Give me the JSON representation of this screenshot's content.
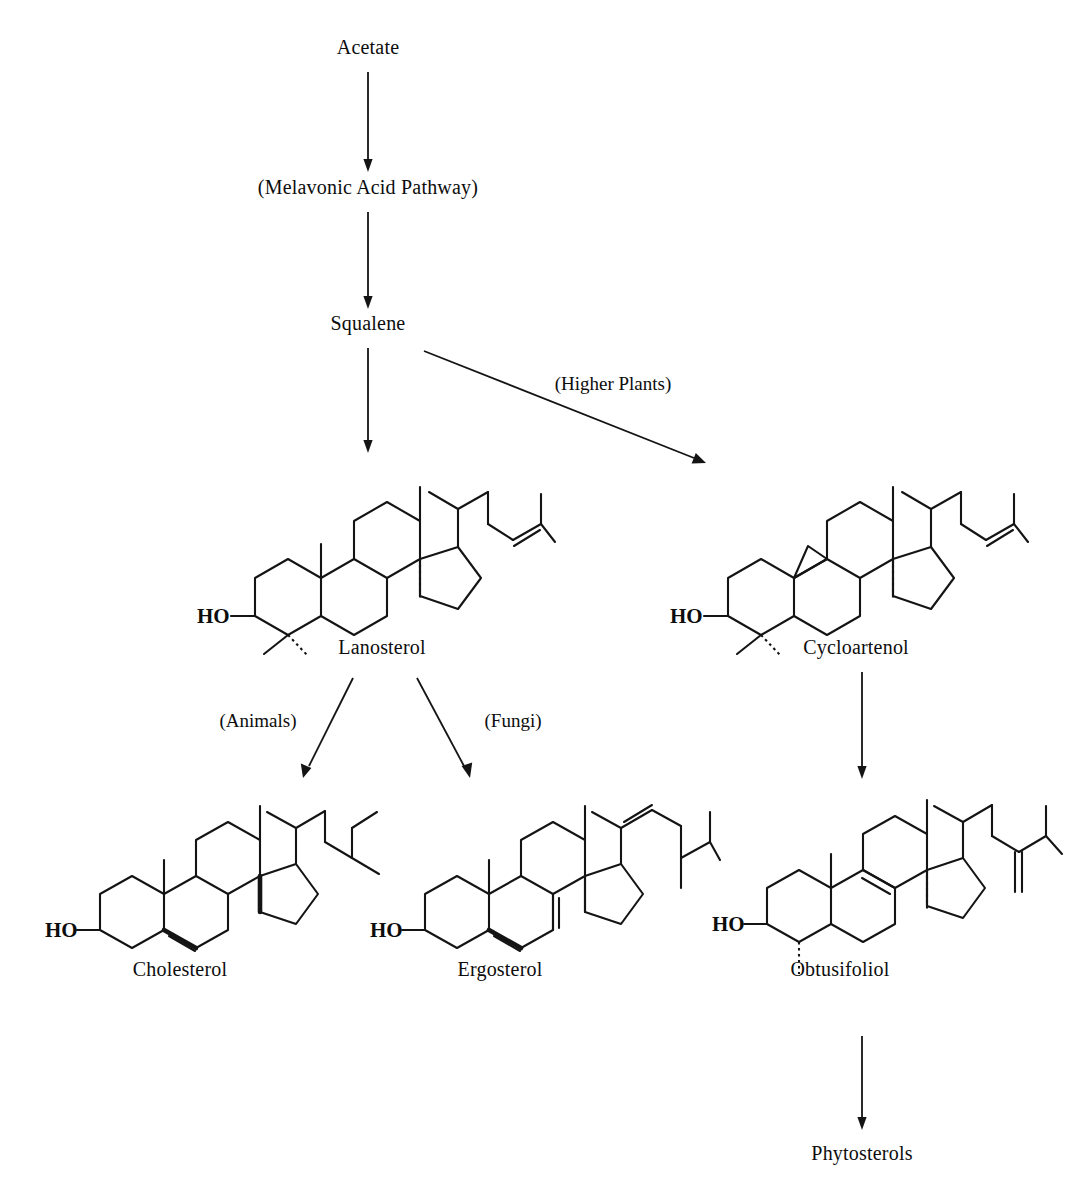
{
  "diagram": {
    "background_color": "#ffffff",
    "ink_color": "#141414",
    "nodes": [
      {
        "id": "acetate",
        "label": "Acetate",
        "x": 368,
        "y": 47,
        "has_structure": false
      },
      {
        "id": "mevalonate",
        "label": "(Melavonic Acid Pathway)",
        "x": 368,
        "y": 187,
        "has_structure": false
      },
      {
        "id": "squalene",
        "label": "Squalene",
        "x": 368,
        "y": 323,
        "has_structure": false
      },
      {
        "id": "lanosterol",
        "label": "Lanosterol",
        "x": 368,
        "y": 646,
        "has_structure": true
      },
      {
        "id": "cycloartenol",
        "label": "Cycloartenol",
        "x": 842,
        "y": 646,
        "has_structure": true
      },
      {
        "id": "cholesterol",
        "label": "Cholesterol",
        "x": 180,
        "y": 968,
        "has_structure": true
      },
      {
        "id": "ergosterol",
        "label": "Ergosterol",
        "x": 502,
        "y": 968,
        "has_structure": true
      },
      {
        "id": "obtusifoliol",
        "label": "Obtusifoliol",
        "x": 842,
        "y": 968,
        "has_structure": true
      },
      {
        "id": "phytosterols",
        "label": "Phytosterols",
        "x": 842,
        "y": 1152,
        "has_structure": false
      }
    ],
    "edges": [
      {
        "id": "acetate-to-mevalonate",
        "from": "acetate",
        "to": "mevalonate",
        "label": "",
        "x1": 368,
        "y1": 72,
        "x2": 368,
        "y2": 168
      },
      {
        "id": "mevalonate-to-squalene",
        "from": "mevalonate",
        "to": "squalene",
        "label": "",
        "x1": 368,
        "y1": 212,
        "x2": 368,
        "y2": 305
      },
      {
        "id": "squalene-to-lanosterol",
        "from": "squalene",
        "to": "lanosterol",
        "label": "",
        "x1": 368,
        "y1": 348,
        "x2": 368,
        "y2": 452
      },
      {
        "id": "squalene-to-cycloartenol",
        "from": "squalene",
        "to": "cycloartenol",
        "label": "(Higher Plants)",
        "x1": 425,
        "y1": 352,
        "x2": 700,
        "y2": 463
      },
      {
        "id": "lanosterol-to-cholesterol",
        "from": "lanosterol",
        "to": "cholesterol",
        "label": "(Animals)",
        "x1": 352,
        "y1": 678,
        "x2": 305,
        "y2": 775
      },
      {
        "id": "lanosterol-to-ergosterol",
        "from": "lanosterol",
        "to": "ergosterol",
        "label": "(Fungi)",
        "x1": 418,
        "y1": 678,
        "x2": 470,
        "y2": 775
      },
      {
        "id": "cycloartenol-to-obtusifoliol",
        "from": "cycloartenol",
        "to": "obtusifoliol",
        "label": "",
        "x1": 862,
        "y1": 670,
        "x2": 862,
        "y2": 778
      },
      {
        "id": "obtusifoliol-to-phytosterols",
        "from": "obtusifoliol",
        "to": "phytosterols",
        "label": "",
        "x1": 862,
        "y1": 1032,
        "x2": 862,
        "y2": 1128
      }
    ],
    "edge_labels": [
      {
        "id": "higher-plants-label",
        "text": "(Higher Plants)",
        "x": 613,
        "y": 384
      },
      {
        "id": "animals-label",
        "text": "(Animals)",
        "x": 258,
        "y": 721
      },
      {
        "id": "fungi-label",
        "text": "(Fungi)",
        "x": 513,
        "y": 721
      }
    ],
    "structures": [
      {
        "id": "lanosterol-structure",
        "compound": "Lanosterol",
        "hydroxyl_label": "HO"
      },
      {
        "id": "cycloartenol-structure",
        "compound": "Cycloartenol",
        "hydroxyl_label": "HO"
      },
      {
        "id": "cholesterol-structure",
        "compound": "Cholesterol",
        "hydroxyl_label": "HO"
      },
      {
        "id": "ergosterol-structure",
        "compound": "Ergosterol",
        "hydroxyl_label": "HO"
      },
      {
        "id": "obtusifoliol-structure",
        "compound": "Obtusifoliol",
        "hydroxyl_label": "HO"
      }
    ]
  }
}
